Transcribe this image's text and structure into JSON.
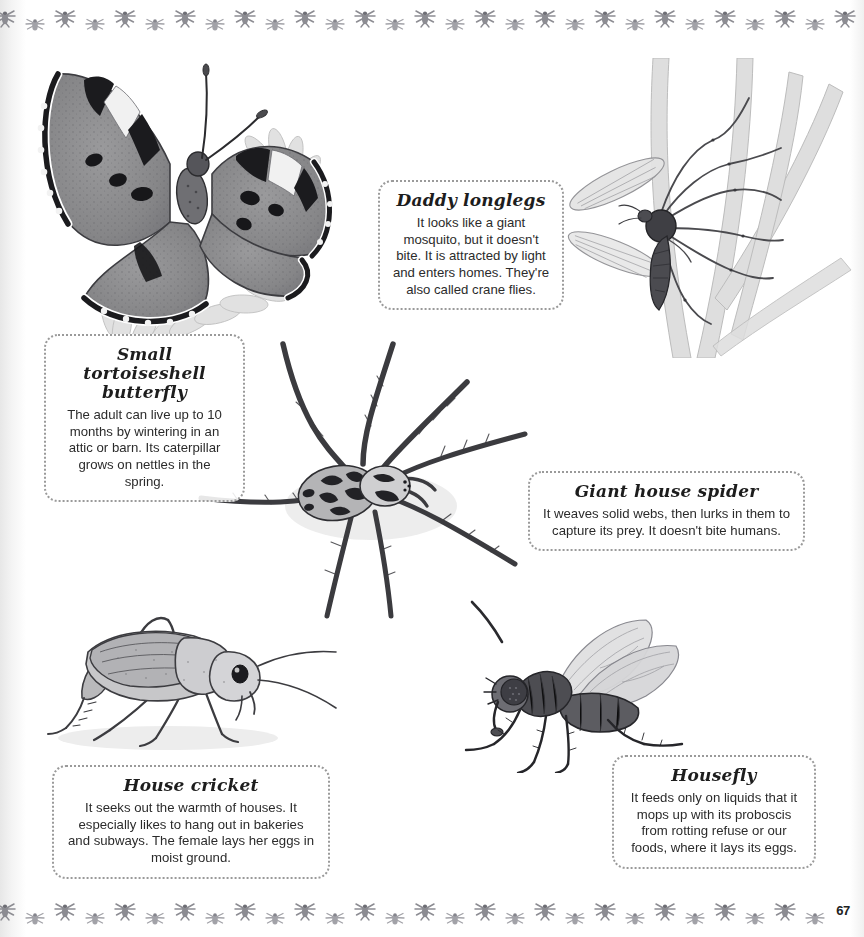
{
  "page": {
    "number": "67",
    "background_color": "#ffffff",
    "text_color": "#2b2b2b",
    "border_motif": "insect-silhouette-pattern"
  },
  "captions": [
    {
      "id": "butterfly",
      "title": "Small tortoiseshell\nbutterfly",
      "body": "The adult can live up to 10 months by wintering in an attic or barn. Its caterpillar grows on nettles in the spring."
    },
    {
      "id": "daddy",
      "title": "Daddy longlegs",
      "body": "It looks like a giant mosquito, but it doesn't bite. It is attracted by light and enters homes. They're also called crane flies."
    },
    {
      "id": "spider",
      "title": "Giant house spider",
      "body": "It weaves solid webs, then lurks in them to capture its prey. It doesn't bite humans."
    },
    {
      "id": "cricket",
      "title": "House cricket",
      "body": "It seeks out the warmth of houses. It especially likes to hang out in bakeries and subways. The female lays her eggs in moist ground."
    },
    {
      "id": "housefly",
      "title": "Housefly",
      "body": "It feeds only on liquids that it mops up with its proboscis from rotting refuse or our foods, where it lays its eggs."
    }
  ],
  "illustrations": [
    {
      "id": "butterfly-illustration",
      "name": "small-tortoiseshell-butterfly-on-flower"
    },
    {
      "id": "cranefly-illustration",
      "name": "daddy-longlegs-crane-fly-on-grass"
    },
    {
      "id": "spider-illustration",
      "name": "giant-house-spider"
    },
    {
      "id": "cricket-illustration",
      "name": "house-cricket"
    },
    {
      "id": "housefly-illustration",
      "name": "housefly"
    }
  ]
}
